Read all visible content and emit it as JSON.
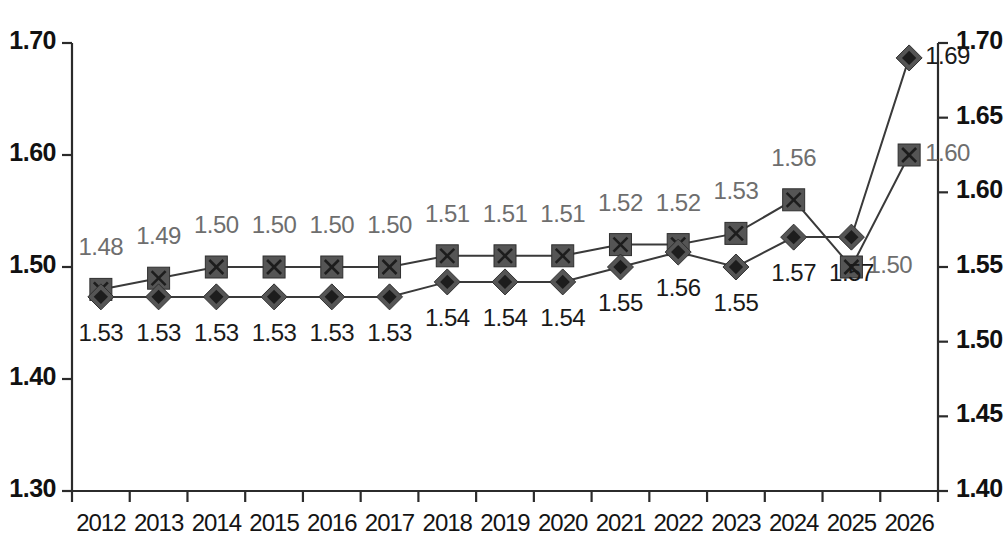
{
  "chart_data": {
    "type": "line",
    "title": "",
    "xlabel": "",
    "ylabel": "",
    "grid": false,
    "legend": "none",
    "categories": [
      "2012",
      "2013",
      "2014",
      "2015",
      "2016",
      "2017",
      "2018",
      "2019",
      "2020",
      "2021",
      "2022",
      "2023",
      "2024",
      "2025",
      "2026"
    ],
    "axes": {
      "left": {
        "ylim": [
          1.3,
          1.7
        ],
        "ticks": [
          "1.30",
          "1.40",
          "1.50",
          "1.60",
          "1.70"
        ],
        "tick_values": [
          1.3,
          1.4,
          1.5,
          1.6,
          1.7
        ]
      },
      "right": {
        "ylim": [
          1.4,
          1.7
        ],
        "ticks": [
          "1.40",
          "1.45",
          "1.50",
          "1.55",
          "1.60",
          "1.65",
          "1.70"
        ],
        "tick_values": [
          1.4,
          1.45,
          1.5,
          1.55,
          1.6,
          1.65,
          1.7
        ]
      }
    },
    "series": [
      {
        "name": "square-series",
        "marker": "square",
        "axis": "left",
        "label_color": "#6e6e6e",
        "label_position": "above",
        "values": [
          1.48,
          1.49,
          1.5,
          1.5,
          1.5,
          1.5,
          1.51,
          1.51,
          1.51,
          1.52,
          1.52,
          1.53,
          1.56,
          1.5,
          1.6
        ],
        "labels": [
          "1.48",
          "1.49",
          "1.50",
          "1.50",
          "1.50",
          "1.50",
          "1.51",
          "1.51",
          "1.51",
          "1.52",
          "1.52",
          "1.53",
          "1.56",
          "1.50",
          "1.60"
        ]
      },
      {
        "name": "diamond-series",
        "marker": "diamond",
        "axis": "right",
        "label_color": "#1a1a1a",
        "label_position": "below",
        "values": [
          1.53,
          1.53,
          1.53,
          1.53,
          1.53,
          1.53,
          1.54,
          1.54,
          1.54,
          1.55,
          1.56,
          1.55,
          1.57,
          1.57,
          1.69
        ],
        "labels": [
          "1.53",
          "1.53",
          "1.53",
          "1.53",
          "1.53",
          "1.53",
          "1.54",
          "1.54",
          "1.54",
          "1.55",
          "1.56",
          "1.55",
          "1.57",
          "1.57",
          "1.69"
        ]
      }
    ],
    "colors": {
      "line": "#3a3a3a",
      "marker": "#555555",
      "axis": "#2b2b2b",
      "upper_label": "#6e6e6e",
      "lower_label": "#1a1a1a"
    }
  }
}
